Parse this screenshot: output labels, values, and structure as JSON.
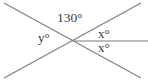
{
  "figure": {
    "kind": "geometry-diagram",
    "background_color": "#ffffff",
    "line_color": "#7d7d7d",
    "text_color": "#3a3a3a",
    "width": 148,
    "height": 81,
    "intersection_point": {
      "x": 73,
      "y": 41
    },
    "lines": [
      {
        "name": "line-top-left-to-bottom-right",
        "x1": 4,
        "y1": 3,
        "x2": 141,
        "y2": 78
      },
      {
        "name": "line-bottom-left-to-top-right",
        "x1": 4,
        "y1": 78,
        "x2": 141,
        "y2": 3
      },
      {
        "name": "ray-horizontal-right",
        "x1": 73,
        "y1": 41,
        "x2": 148,
        "y2": 41
      }
    ],
    "labels": {
      "angle_130": "130°",
      "angle_y": "y°",
      "angle_x_upper": "x°",
      "angle_x_lower": "x°"
    }
  }
}
